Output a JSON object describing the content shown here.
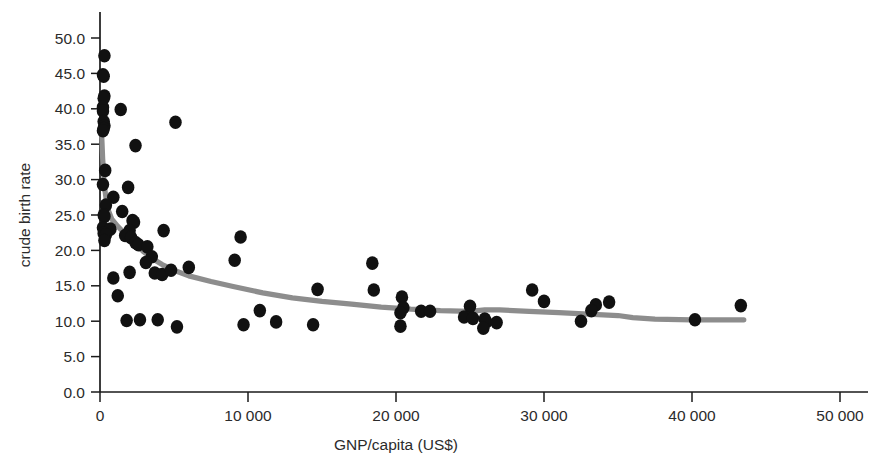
{
  "chart_data": {
    "type": "scatter",
    "title": "",
    "xlabel": "GNP/capita (US$)",
    "ylabel": "crude birth rate",
    "xlim": [
      0,
      52500
    ],
    "ylim": [
      0,
      52.5
    ],
    "xticks": [
      0,
      10000,
      20000,
      30000,
      40000,
      50000
    ],
    "xtick_labels": [
      "0",
      "10 000",
      "20 000",
      "30 000",
      "40 000",
      "50 000"
    ],
    "yticks": [
      0.0,
      5.0,
      10.0,
      15.0,
      20.0,
      25.0,
      30.0,
      35.0,
      40.0,
      45.0,
      50.0
    ],
    "ytick_labels": [
      "0.0",
      "5.0",
      "10.0",
      "15.0",
      "20.0",
      "25.0",
      "30.0",
      "35.0",
      "40.0",
      "45.0",
      "50.0"
    ],
    "grid": false,
    "legend": false,
    "marker_color": "#111111",
    "marker_size": 7,
    "series": [
      {
        "name": "countries",
        "type": "scatter",
        "points": [
          [
            300,
            47.5
          ],
          [
            200,
            44.8
          ],
          [
            250,
            44.6
          ],
          [
            300,
            41.8
          ],
          [
            250,
            41.5
          ],
          [
            200,
            40.2
          ],
          [
            1400,
            39.9
          ],
          [
            200,
            39.7
          ],
          [
            250,
            38.2
          ],
          [
            300,
            37.6
          ],
          [
            5100,
            38.1
          ],
          [
            250,
            37.2
          ],
          [
            200,
            36.9
          ],
          [
            2400,
            34.8
          ],
          [
            350,
            31.3
          ],
          [
            200,
            29.3
          ],
          [
            1900,
            28.9
          ],
          [
            900,
            27.5
          ],
          [
            400,
            26.4
          ],
          [
            1500,
            25.5
          ],
          [
            250,
            25.0
          ],
          [
            300,
            24.8
          ],
          [
            2200,
            24.2
          ],
          [
            2300,
            24.0
          ],
          [
            200,
            23.2
          ],
          [
            700,
            23.0
          ],
          [
            2000,
            22.8
          ],
          [
            4300,
            22.8
          ],
          [
            9500,
            21.9
          ],
          [
            250,
            22.4
          ],
          [
            400,
            22.2
          ],
          [
            1700,
            22.1
          ],
          [
            2100,
            21.8
          ],
          [
            300,
            21.4
          ],
          [
            2400,
            21.1
          ],
          [
            2600,
            20.8
          ],
          [
            3200,
            20.5
          ],
          [
            3500,
            19.1
          ],
          [
            9100,
            18.6
          ],
          [
            18400,
            18.2
          ],
          [
            3100,
            18.3
          ],
          [
            6000,
            17.6
          ],
          [
            2000,
            16.9
          ],
          [
            3700,
            16.8
          ],
          [
            4200,
            16.6
          ],
          [
            4800,
            17.2
          ],
          [
            900,
            16.1
          ],
          [
            14700,
            14.5
          ],
          [
            18500,
            14.4
          ],
          [
            29200,
            14.4
          ],
          [
            20400,
            13.4
          ],
          [
            1200,
            13.6
          ],
          [
            30000,
            12.8
          ],
          [
            34400,
            12.7
          ],
          [
            33500,
            12.3
          ],
          [
            43300,
            12.2
          ],
          [
            25000,
            12.1
          ],
          [
            20500,
            11.9
          ],
          [
            10800,
            11.5
          ],
          [
            33200,
            11.5
          ],
          [
            21700,
            11.4
          ],
          [
            22300,
            11.4
          ],
          [
            20300,
            11.2
          ],
          [
            24600,
            10.6
          ],
          [
            25200,
            10.4
          ],
          [
            26000,
            10.3
          ],
          [
            26100,
            9.9
          ],
          [
            1800,
            10.1
          ],
          [
            2700,
            10.2
          ],
          [
            3900,
            10.2
          ],
          [
            11900,
            9.9
          ],
          [
            40200,
            10.2
          ],
          [
            32500,
            10.0
          ],
          [
            26800,
            9.8
          ],
          [
            9700,
            9.5
          ],
          [
            14400,
            9.5
          ],
          [
            5200,
            9.2
          ],
          [
            20300,
            9.3
          ],
          [
            25900,
            9.0
          ]
        ]
      },
      {
        "name": "smoothed trend",
        "type": "line",
        "color": "#8d8d8d",
        "points": [
          [
            120,
            36.0
          ],
          [
            180,
            33.0
          ],
          [
            300,
            29.0
          ],
          [
            500,
            26.0
          ],
          [
            800,
            24.4
          ],
          [
            1200,
            23.4
          ],
          [
            1700,
            22.3
          ],
          [
            2300,
            21.0
          ],
          [
            2900,
            19.9
          ],
          [
            3500,
            18.9
          ],
          [
            4200,
            18.0
          ],
          [
            5000,
            17.2
          ],
          [
            6000,
            16.4
          ],
          [
            7500,
            15.6
          ],
          [
            9000,
            14.9
          ],
          [
            11000,
            14.0
          ],
          [
            13000,
            13.3
          ],
          [
            15000,
            12.8
          ],
          [
            17000,
            12.4
          ],
          [
            19000,
            12.0
          ],
          [
            21000,
            11.7
          ],
          [
            23000,
            11.5
          ],
          [
            25000,
            11.4
          ],
          [
            26000,
            11.6
          ],
          [
            27000,
            11.6
          ],
          [
            29000,
            11.4
          ],
          [
            31000,
            11.2
          ],
          [
            33000,
            11.0
          ],
          [
            35000,
            10.8
          ],
          [
            36000,
            10.5
          ],
          [
            37500,
            10.3
          ],
          [
            40000,
            10.2
          ],
          [
            43500,
            10.2
          ]
        ]
      }
    ]
  }
}
